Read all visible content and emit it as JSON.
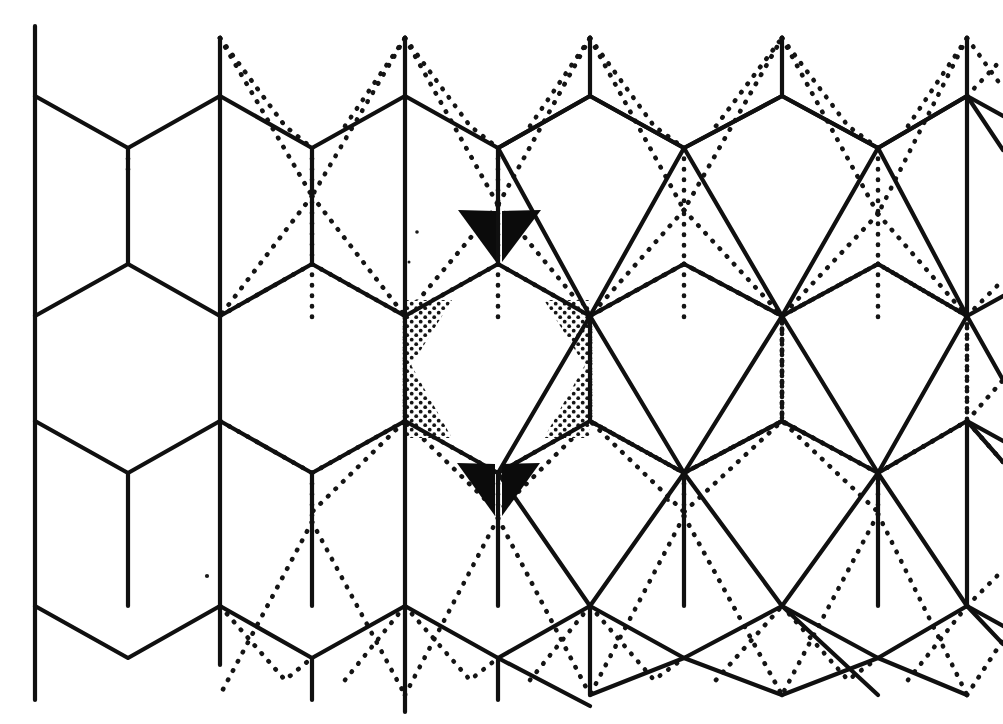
{
  "figure": {
    "background_color": "#ffffff",
    "ink_color": "#101010",
    "canvas": {
      "width": 1003,
      "height": 724
    }
  },
  "geometry": {
    "columns_x": [
      35,
      220,
      405,
      590,
      782,
      967
    ],
    "column_spacing": 186,
    "rows_y": [
      38,
      96,
      316,
      421,
      606,
      695
    ],
    "notes": "Vertical bonds run between y=96..316 and y=421..606 in the left-hand honeycomb; zig-zag apexes sit at y=38 and y=695."
  },
  "solid_lattice": {
    "name": "honeycomb-to-rhombic solid network",
    "stroke_width": 4.2,
    "stroke_color": "#101010",
    "paths": [
      "M 35 28 L 35 96 L 128 148 L 220 96 L 220 38",
      "M 220 38 L 220 96",
      "M 405 38 L 405 96 L 498 148 L 590 96 L 590 38",
      "M 590 38 L 590 96",
      "M 220 96 L 312 148 L 405 96",
      "M 590 96 L 684 148 L 782 96",
      "M 782 38 L 782 96 L 878 148 L 967 96 L 967 38",
      "M 35 96 L 35 316",
      "M 220 96 L 220 316",
      "M 405 96 L 405 316",
      "M 590 96 L 590 316",
      "M 782 96 L 782 316",
      "M 967 96 L 967 316",
      "M 35 316 L 128 264 L 220 316",
      "M 220 316 L 312 264 L 405 316",
      "M 405 316 L 498 264 L 590 316",
      "M 590 316 L 684 264 L 782 316",
      "M 782 316 L 878 264 L 967 316",
      "M 35 316 L 35 421",
      "M 220 316 L 220 421",
      "M 405 316 L 405 421",
      "M 590 316 L 590 421",
      "M 782 316 L 782 421",
      "M 967 316 L 967 421",
      "M 35 421 L 128 473 L 220 421",
      "M 220 421 L 312 473 L 405 421",
      "M 405 421 L 498 473 L 590 421",
      "M 590 421 L 684 473 L 782 421",
      "M 782 421 L 878 473 L 967 421",
      "M 35 421 L 35 606",
      "M 220 421 L 220 606",
      "M 405 421 L 405 606",
      "M 590 421 L 590 606",
      "M 782 421 L 782 606",
      "M 967 421 L 967 606",
      "M 35 606 L 128 658 L 220 606",
      "M 220 606 L 312 658 L 405 606",
      "M 405 606 L 498 658 L 590 606",
      "M 590 606 L 684 658 L 782 606",
      "M 782 606 L 878 658 L 967 606",
      "M 35 606 L 35 700",
      "M 220 606 L 220 695",
      "M 405 606 L 405 695",
      "M 590 606 L 590 695",
      "M 782 606 L 782 695",
      "M 967 606 L 967 695"
    ]
  },
  "dotted_lattice": {
    "name": "conjugate dotted network",
    "stroke_width": 4.6,
    "dash_pattern": "0.5 10",
    "stroke_color": "#141414"
  },
  "shaded_wedges": {
    "black": [
      {
        "name": "top-black-wedge-left",
        "points": "460,211 498,258 498,212"
      },
      {
        "name": "top-black-wedge-right",
        "points": "540,211 503,258 503,212"
      },
      {
        "name": "bottom-black-wedge-left",
        "points": "459,463 496,512 496,466"
      },
      {
        "name": "bottom-black-wedge-right",
        "points": "540,463 503,512 503,466"
      }
    ],
    "stipple": [
      {
        "name": "stipple-wedge-upper-left",
        "points": "406,300 448,300 406,372"
      },
      {
        "name": "stipple-wedge-lower-left",
        "points": "406,422 448,422 406,352"
      },
      {
        "name": "stipple-wedge-upper-right",
        "points": "592,300 550,300 592,372"
      },
      {
        "name": "stipple-wedge-lower-right",
        "points": "592,422 550,422 592,352"
      }
    ]
  },
  "specks": [
    {
      "name": "speck-a",
      "cx": 207,
      "cy": 576,
      "r": 2.1
    },
    {
      "name": "speck-b",
      "cx": 417,
      "cy": 232,
      "r": 1.8
    },
    {
      "name": "speck-c",
      "cx": 668,
      "cy": 500,
      "r": 1.9
    },
    {
      "name": "speck-d",
      "cx": 409,
      "cy": 260,
      "r": 1.5
    }
  ],
  "legend": {
    "solid_phase_label": "solid network",
    "dotted_phase_label": "dotted network",
    "black_wedge_label": "black mismatch wedge",
    "stipple_wedge_label": "stippled mismatch wedge"
  }
}
